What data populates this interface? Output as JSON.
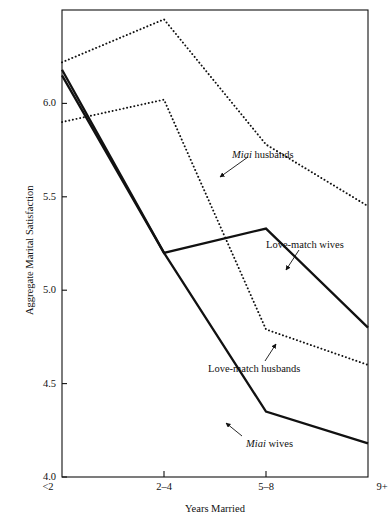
{
  "chart_data": {
    "type": "line",
    "title": "",
    "xlabel": "Years Married",
    "ylabel": "Aggregate Marital Satisfaction",
    "categories": [
      "<2",
      "2–4",
      "5–8",
      "9+"
    ],
    "ylim": [
      4.0,
      6.5
    ],
    "yticks": [
      "4.0",
      "4.5",
      "5.0",
      "5.5",
      "6.0"
    ],
    "ytick_values": [
      4.0,
      4.5,
      5.0,
      5.5,
      6.0
    ],
    "grid": false,
    "legend": "inline-annotations",
    "series": [
      {
        "name": "Miai husbands",
        "style": "dotted",
        "values": [
          6.22,
          6.45,
          5.78,
          5.45
        ]
      },
      {
        "name": "Love-match wives",
        "style": "solid",
        "values": [
          6.15,
          5.2,
          5.33,
          4.8
        ]
      },
      {
        "name": "Love-match husbands",
        "style": "dotted",
        "values": [
          5.9,
          6.02,
          4.79,
          4.6
        ]
      },
      {
        "name": "Miai wives",
        "style": "solid",
        "values": [
          6.18,
          5.2,
          4.35,
          4.18
        ]
      }
    ],
    "annotations": [
      {
        "id": "miai-husbands",
        "italic_prefix": "Miai",
        "rest": " husbands",
        "text": "Miai husbands",
        "label_x": 232,
        "label_y": 150,
        "arrow_from_x": 248,
        "arrow_from_y": 157,
        "arrow_to_x": 220,
        "arrow_to_y": 177
      },
      {
        "id": "love-match-wives",
        "italic_prefix": "",
        "rest": "Love-match wives",
        "text": "Love-match wives",
        "label_x": 266,
        "label_y": 240,
        "arrow_from_x": 299,
        "arrow_from_y": 250,
        "arrow_to_x": 286,
        "arrow_to_y": 270
      },
      {
        "id": "love-match-husbands",
        "italic_prefix": "",
        "rest": "Love-match husbands",
        "text": "Love-match husbands",
        "label_x": 208,
        "label_y": 364,
        "arrow_from_x": 265,
        "arrow_from_y": 361,
        "arrow_to_x": 276,
        "arrow_to_y": 344
      },
      {
        "id": "miai-wives",
        "italic_prefix": "Miai",
        "rest": " wives",
        "text": "Miai wives",
        "label_x": 246,
        "label_y": 439,
        "arrow_from_x": 242,
        "arrow_from_y": 436,
        "arrow_to_x": 226,
        "arrow_to_y": 423
      }
    ]
  },
  "axes": {
    "y_title": "Aggregate Marital Satisfaction",
    "x_title": "Years Married",
    "y_ticks": [
      {
        "label": "6.0",
        "value": 6.0
      },
      {
        "label": "5.5",
        "value": 5.5
      },
      {
        "label": "5.0",
        "value": 5.0
      },
      {
        "label": "4.5",
        "value": 4.5
      },
      {
        "label": "4.0",
        "value": 4.0
      }
    ],
    "x_ticks": [
      {
        "label": "<2"
      },
      {
        "label": "2–4"
      },
      {
        "label": "5–8"
      },
      {
        "label": "9+"
      }
    ]
  },
  "colors": {
    "ink": "#111111",
    "axis": "#111111",
    "background": "#ffffff"
  }
}
